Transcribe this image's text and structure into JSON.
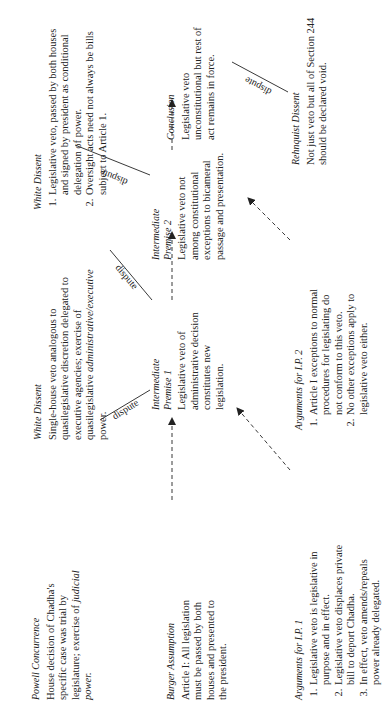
{
  "diagram": {
    "nodes": {
      "powell": {
        "title": "Powell Concurrence",
        "body_pre": "House decision of Chadha's specific case was trial by legislature; exercise of ",
        "body_ital": "judicial power."
      },
      "burger": {
        "title": "Burger Assumption",
        "body": "Article I: All legislation must be passed by both houses and presented to the president."
      },
      "args_ip1": {
        "title": "Arguments for I.P. 1",
        "items": [
          "Legislative veto is legislative in purpose and in effect.",
          "Legislative veto displaces private bill to deport Chadha.",
          "In effect, veto amends/repeals power already delegated."
        ]
      },
      "white1": {
        "title": "White Dissent",
        "body_pre": "Single-house veto analogous to quasilegislative discretion delegated to executive agencies; exercise of quasilegislative ",
        "body_ital": "administrative/executive",
        "body_post": " power."
      },
      "ip1": {
        "title_line1": "Intermediate",
        "title_line2": "Premise 1",
        "body": "Legislative veto of administrative decision constitutes new legislation."
      },
      "args_ip2": {
        "title": "Arguments for I.P. 2",
        "items": [
          "Article I exceptions to normal procedures for legislating do not conform to this veto.",
          "No other exceptions apply to legislative veto either."
        ]
      },
      "white2": {
        "title": "White Dissent",
        "items": [
          "Legislative veto, passed by both houses and signed by president as conditional delegation of power.",
          "Oversight acts need not always be bills subject to Article 1."
        ]
      },
      "ip2": {
        "title_line1": "Intermediate",
        "title_line2": "Premise 2",
        "body": "Legislative veto not among constitutional exceptions to bicameral passage and presentation."
      },
      "conclusion": {
        "title": "Conclusion",
        "body": "Legislative veto unconstitutional but rest of act remains in force."
      },
      "rehnquist": {
        "title": "Rehnquist Dissent",
        "body": "Not just veto but all of Section 244 should be declared void."
      }
    },
    "edge_labels": {
      "dispute_powell": "dispute",
      "dispute_white1": "dispute",
      "dispute_white2": "dispute",
      "dispute_rehnquist": "dispute"
    }
  }
}
